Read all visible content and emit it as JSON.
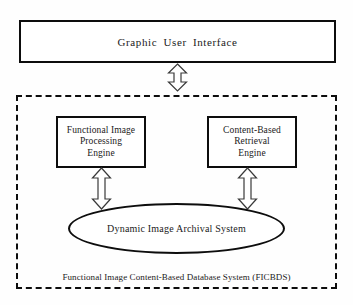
{
  "figure": {
    "background_color": "#fefefe",
    "line_color": "#0d0d0d",
    "text_color": "#1a1a1a"
  },
  "gui": {
    "label": "Graphic  User   Interface"
  },
  "system": {
    "caption": "Functional Image Content-Based Database System (FICBDS)",
    "border_style": "dashed"
  },
  "engines": [
    {
      "id": "functional-image-processing-engine",
      "lines": [
        "Functional Image",
        "Processing",
        "Engine"
      ]
    },
    {
      "id": "content-based-retrieval-engine",
      "lines": [
        "Content-Based",
        "Retrieval",
        "Engine"
      ]
    }
  ],
  "archive": {
    "label": "Dynamic Image Archival System",
    "shape": "ellipse"
  },
  "connectors": [
    {
      "id": "gui-to-system",
      "icon": "double-headed-vertical-arrow-icon",
      "from": "Graphic User Interface",
      "to": "Functional Image Content-Based Database System (FICBDS)"
    },
    {
      "id": "processing-engine-to-archive",
      "icon": "double-headed-vertical-arrow-icon",
      "from": "Functional Image Processing Engine",
      "to": "Dynamic Image Archival System"
    },
    {
      "id": "retrieval-engine-to-archive",
      "icon": "double-headed-vertical-arrow-icon",
      "from": "Content-Based Retrieval Engine",
      "to": "Dynamic Image Archival System"
    }
  ]
}
